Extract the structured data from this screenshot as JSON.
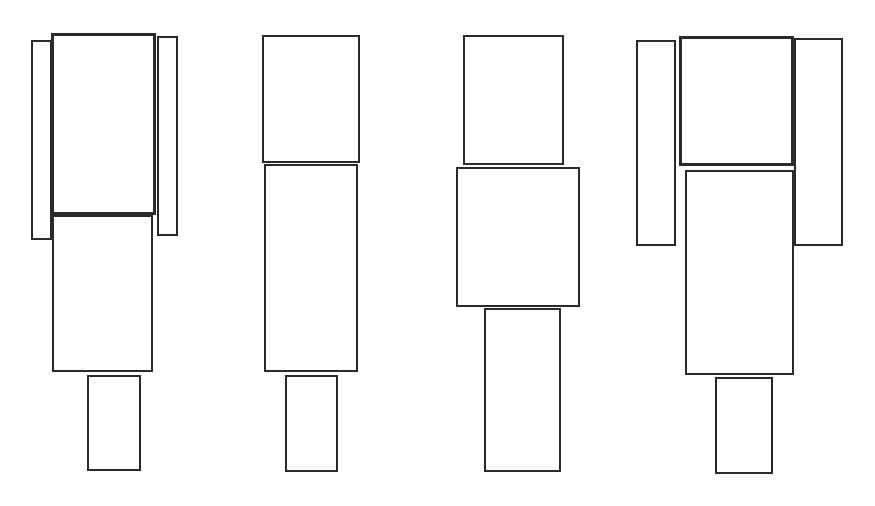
{
  "diagram": {
    "background": "#ffffff",
    "stroke": "#2a2a2a",
    "figures": [
      {
        "name": "figure-1",
        "rects": [
          {
            "role": "left-side",
            "x": 31,
            "y": 40,
            "w": 21,
            "h": 200
          },
          {
            "role": "right-side",
            "x": 157,
            "y": 36,
            "w": 21,
            "h": 200
          },
          {
            "role": "top",
            "x": 51,
            "y": 33,
            "w": 105,
            "h": 182,
            "thick": true
          },
          {
            "role": "middle",
            "x": 52,
            "y": 215,
            "w": 101,
            "h": 157
          },
          {
            "role": "bottom",
            "x": 87,
            "y": 375,
            "w": 54,
            "h": 96
          }
        ]
      },
      {
        "name": "figure-2",
        "rects": [
          {
            "role": "top",
            "x": 262,
            "y": 35,
            "w": 98,
            "h": 128
          },
          {
            "role": "middle",
            "x": 264,
            "y": 164,
            "w": 94,
            "h": 208
          },
          {
            "role": "bottom",
            "x": 285,
            "y": 375,
            "w": 53,
            "h": 97
          }
        ]
      },
      {
        "name": "figure-3",
        "rects": [
          {
            "role": "top",
            "x": 463,
            "y": 35,
            "w": 101,
            "h": 130
          },
          {
            "role": "middle",
            "x": 456,
            "y": 167,
            "w": 124,
            "h": 140
          },
          {
            "role": "bottom",
            "x": 484,
            "y": 308,
            "w": 77,
            "h": 164
          }
        ]
      },
      {
        "name": "figure-4",
        "rects": [
          {
            "role": "left-side",
            "x": 636,
            "y": 40,
            "w": 40,
            "h": 206
          },
          {
            "role": "right-side",
            "x": 794,
            "y": 38,
            "w": 49,
            "h": 208
          },
          {
            "role": "top",
            "x": 679,
            "y": 36,
            "w": 115,
            "h": 130,
            "thick": true
          },
          {
            "role": "middle",
            "x": 685,
            "y": 170,
            "w": 109,
            "h": 205
          },
          {
            "role": "bottom",
            "x": 715,
            "y": 377,
            "w": 58,
            "h": 97
          }
        ]
      }
    ]
  }
}
